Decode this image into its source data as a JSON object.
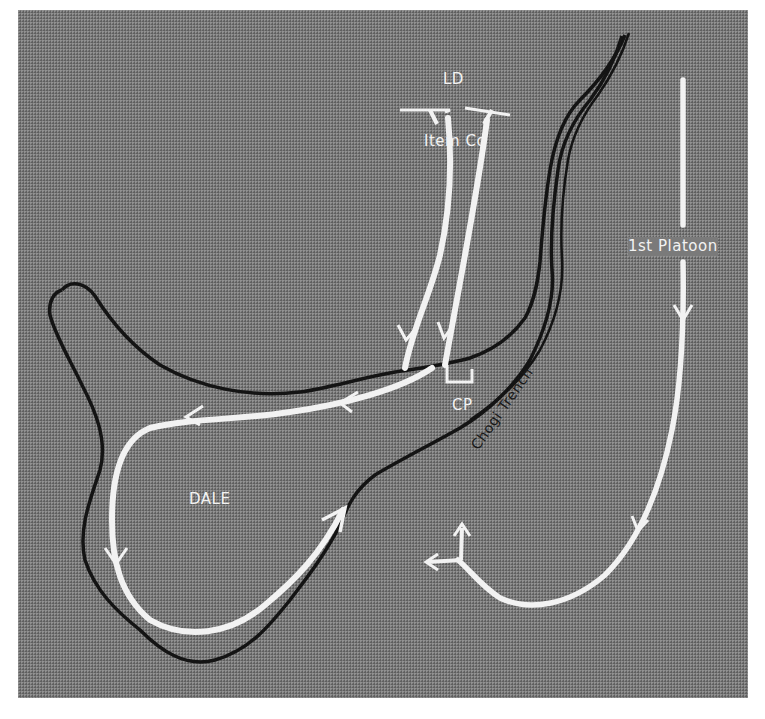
{
  "map": {
    "labels": {
      "line_of_departure": "LD",
      "unit_item_co": "Item Co",
      "unit_1st_platoon": "1st Platoon",
      "command_post": "CP",
      "objective": "DALE",
      "trench": "Chogi Trench"
    },
    "colors": {
      "terrain": "#7a7a7a",
      "routes": "#f2f2f2",
      "outlines": "#141414",
      "frame_border": "#ffffff"
    },
    "routes": [
      {
        "unit": "Item Co",
        "description": "two columns advancing south from LD to the ridge near CP"
      },
      {
        "unit": "Item Co",
        "description": "sweep west along ridge, south around DALE and back northeast"
      },
      {
        "unit": "1st Platoon",
        "description": "advance south along east side, curving west then splitting north and west"
      }
    ]
  }
}
